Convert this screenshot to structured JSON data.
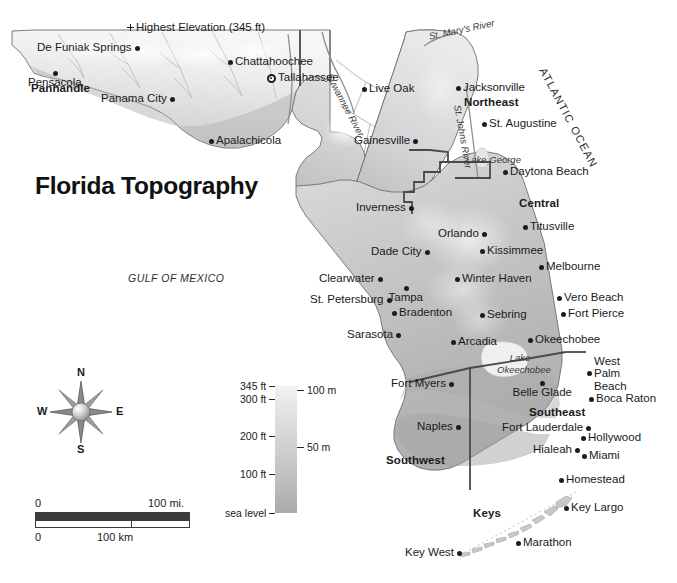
{
  "title": "Florida Topography",
  "ocean_labels": {
    "gulf": "GULF  OF  MEXICO",
    "atlantic": "ATLANTIC OCEAN"
  },
  "regions": [
    {
      "name": "Panhandle",
      "x": 60,
      "y": 89
    },
    {
      "name": "Northeast",
      "x": 491,
      "y": 103
    },
    {
      "name": "Central",
      "x": 539,
      "y": 204
    },
    {
      "name": "Southeast",
      "x": 557,
      "y": 413
    },
    {
      "name": "Southwest",
      "x": 415,
      "y": 461
    },
    {
      "name": "Keys",
      "x": 487,
      "y": 514
    }
  ],
  "poi": [
    {
      "name": "Highest Elevation (345 ft)",
      "x": 130,
      "y": 27,
      "marker": "cross",
      "anchor": "left"
    }
  ],
  "capitals": [
    {
      "name": "Tallahassee",
      "x": 271,
      "y": 78,
      "anchor": "left"
    }
  ],
  "cities": [
    {
      "name": "De Funiak Springs",
      "x": 137,
      "y": 48,
      "anchor": "right"
    },
    {
      "name": "Pensacola",
      "x": 55,
      "y": 73,
      "anchor": "below"
    },
    {
      "name": "Panama City",
      "x": 172,
      "y": 99,
      "anchor": "right"
    },
    {
      "name": "Apalachicola",
      "x": 211,
      "y": 141,
      "anchor": "left"
    },
    {
      "name": "Chattahoochee",
      "x": 230,
      "y": 62,
      "anchor": "left"
    },
    {
      "name": "Live Oak",
      "x": 364,
      "y": 89,
      "anchor": "left"
    },
    {
      "name": "Jacksonville",
      "x": 458,
      "y": 88,
      "anchor": "left"
    },
    {
      "name": "St. Augustine",
      "x": 484,
      "y": 124,
      "anchor": "left"
    },
    {
      "name": "Gainesville",
      "x": 415,
      "y": 141,
      "anchor": "right"
    },
    {
      "name": "Daytona Beach",
      "x": 505,
      "y": 172,
      "anchor": "left"
    },
    {
      "name": "Inverness",
      "x": 411,
      "y": 208,
      "anchor": "right"
    },
    {
      "name": "Titusville",
      "x": 525,
      "y": 227,
      "anchor": "left"
    },
    {
      "name": "Orlando",
      "x": 484,
      "y": 234,
      "anchor": "right"
    },
    {
      "name": "Kissimmee",
      "x": 482,
      "y": 251,
      "anchor": "left"
    },
    {
      "name": "Dade City",
      "x": 427,
      "y": 252,
      "anchor": "right"
    },
    {
      "name": "Melbourne",
      "x": 541,
      "y": 267,
      "anchor": "left"
    },
    {
      "name": "Clearwater",
      "x": 380,
      "y": 279,
      "anchor": "right"
    },
    {
      "name": "Winter Haven",
      "x": 457,
      "y": 279,
      "anchor": "left"
    },
    {
      "name": "Tampa",
      "x": 406,
      "y": 288,
      "anchor": "below"
    },
    {
      "name": "St. Petersburg",
      "x": 389,
      "y": 300,
      "anchor": "right"
    },
    {
      "name": "Vero Beach",
      "x": 559,
      "y": 298,
      "anchor": "left"
    },
    {
      "name": "Bradenton",
      "x": 394,
      "y": 313,
      "anchor": "left"
    },
    {
      "name": "Sebring",
      "x": 482,
      "y": 315,
      "anchor": "left"
    },
    {
      "name": "Fort Pierce",
      "x": 563,
      "y": 314,
      "anchor": "left"
    },
    {
      "name": "Sarasota",
      "x": 398,
      "y": 335,
      "anchor": "right"
    },
    {
      "name": "Arcadia",
      "x": 453,
      "y": 342,
      "anchor": "left"
    },
    {
      "name": "Okeechobee",
      "x": 530,
      "y": 340,
      "anchor": "left"
    },
    {
      "name": "West Palm Beach",
      "x": 589,
      "y": 373,
      "anchor": "left"
    },
    {
      "name": "Fort Myers",
      "x": 451,
      "y": 384,
      "anchor": "right"
    },
    {
      "name": "Belle Glade",
      "x": 542,
      "y": 383,
      "anchor": "below"
    },
    {
      "name": "Boca Raton",
      "x": 591,
      "y": 399,
      "anchor": "left"
    },
    {
      "name": "Naples",
      "x": 458,
      "y": 427,
      "anchor": "right"
    },
    {
      "name": "Fort Lauderdale",
      "x": 588,
      "y": 428,
      "anchor": "right"
    },
    {
      "name": "Hollywood",
      "x": 583,
      "y": 438,
      "anchor": "left"
    },
    {
      "name": "Hialeah",
      "x": 577,
      "y": 450,
      "anchor": "right"
    },
    {
      "name": "Miami",
      "x": 584,
      "y": 456,
      "anchor": "left"
    },
    {
      "name": "Homestead",
      "x": 561,
      "y": 480,
      "anchor": "left"
    },
    {
      "name": "Key Largo",
      "x": 566,
      "y": 508,
      "anchor": "left"
    },
    {
      "name": "Marathon",
      "x": 518,
      "y": 543,
      "anchor": "left"
    },
    {
      "name": "Key West",
      "x": 459,
      "y": 553,
      "anchor": "right"
    }
  ],
  "water_features": [
    {
      "name": "St. Mary's River",
      "x": 428,
      "y": 32,
      "rot": -12
    },
    {
      "name": "Suwannee River",
      "x": 333,
      "y": 72,
      "rot": 62
    },
    {
      "name": "St. Johns River",
      "x": 462,
      "y": 104,
      "rot": 80
    },
    {
      "name": "Lake George",
      "x": 466,
      "y": 155,
      "rot": 0
    },
    {
      "name": "Lake Okeechobee",
      "x": 497,
      "y": 352,
      "rot": 0
    }
  ],
  "elevation_legend": {
    "title": "",
    "ticks_ft": [
      {
        "label": "345 ft",
        "pos": 0
      },
      {
        "label": "300 ft",
        "pos": 13
      },
      {
        "label": "200 ft",
        "pos": 50
      },
      {
        "label": "100 ft",
        "pos": 88
      },
      {
        "label": "sea level",
        "pos": 127
      }
    ],
    "ticks_m": [
      {
        "label": "100 m",
        "pos": 4
      },
      {
        "label": "50 m",
        "pos": 61
      }
    ]
  },
  "scale_bar": {
    "miles": {
      "start": "0",
      "end": "100 mi."
    },
    "km": {
      "start": "0",
      "end": "100 km"
    }
  },
  "compass": {
    "north": "N",
    "south": "S",
    "east": "E",
    "west": "W"
  },
  "colors": {
    "land_low": "#b4b4b4",
    "land_high": "#f4f4f4",
    "outline": "#6e6e6e",
    "boundary": "#4a4a4a",
    "marker": "#1c1c1c",
    "text": "#1a1a1a"
  }
}
